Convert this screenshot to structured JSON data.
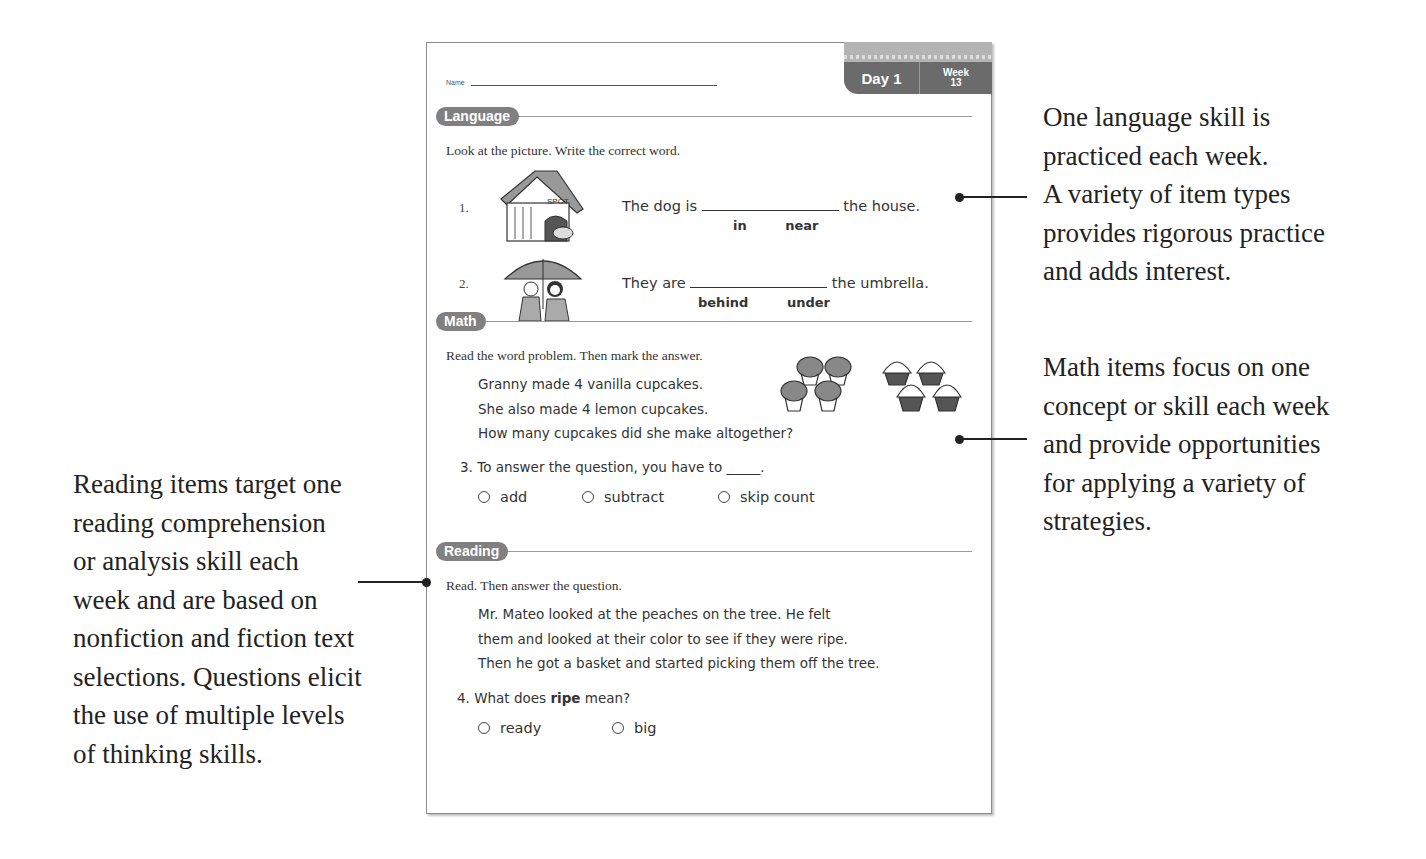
{
  "worksheet": {
    "name_label": "Name",
    "tab": {
      "day_label": "Day 1",
      "week_label": "Week",
      "week_number": "13"
    },
    "sections": {
      "language": {
        "title": "Language",
        "instruction": "Look at the picture. Write the correct word.",
        "items": [
          {
            "number": "1.",
            "image": "doghouse-illustration",
            "image_sign": "SPOT",
            "before": "The dog is",
            "after": "the house.",
            "choices": [
              "in",
              "near"
            ]
          },
          {
            "number": "2.",
            "image": "umbrella-illustration",
            "before": "They are",
            "after": "the umbrella.",
            "choices": [
              "behind",
              "under"
            ]
          }
        ]
      },
      "math": {
        "title": "Math",
        "instruction": "Read the word problem. Then mark the answer.",
        "problem": [
          "Granny made 4 vanilla cupcakes.",
          "She also made 4 lemon cupcakes.",
          "How many cupcakes did she make altogether?"
        ],
        "question": {
          "number": "3.",
          "text": "To answer the question, you have to _____.",
          "options": [
            "add",
            "subtract",
            "skip count"
          ]
        },
        "images": [
          "vanilla-cupcakes-x4",
          "lemon-cupcakes-x4"
        ]
      },
      "reading": {
        "title": "Reading",
        "instruction": "Read. Then answer the question.",
        "passage": [
          "Mr. Mateo looked at the peaches on the tree. He felt",
          "them and looked at their color to see if they were ripe.",
          "Then he got a basket and started picking them off the tree."
        ],
        "question": {
          "number": "4.",
          "prefix": "What does",
          "bold_word": "ripe",
          "suffix": "mean?",
          "options": [
            "ready",
            "big"
          ]
        }
      }
    }
  },
  "annotations": {
    "language": [
      "One language skill is",
      "practiced each week.",
      "A variety of item types",
      "provides rigorous practice",
      "and adds interest."
    ],
    "math": [
      "Math items focus on one",
      "concept or skill each week",
      "and provide opportunities",
      "for applying a variety of",
      "strategies."
    ],
    "reading": [
      "Reading items target one",
      "reading comprehension",
      "or analysis skill each",
      "week and are based on",
      "nonfiction and fiction text",
      "selections. Questions elicit",
      "the use of multiple levels",
      "of thinking skills."
    ]
  },
  "colors": {
    "section_pill": "#808080",
    "tab_dark": "#6b6b6b",
    "tab_light": "#b4b4b4",
    "text": "#333333"
  }
}
